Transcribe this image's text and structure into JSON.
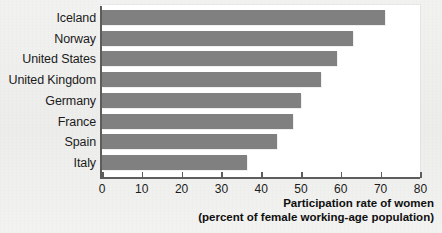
{
  "chart_data": {
    "type": "bar",
    "orientation": "horizontal",
    "title": "",
    "xlabel": "Participation rate of women (percent of female working-age population)",
    "ylabel": "",
    "xlim": [
      0,
      80
    ],
    "ylim": null,
    "grid": false,
    "legend": null,
    "categories": [
      "Iceland",
      "Norway",
      "United States",
      "United Kingdom",
      "Germany",
      "France",
      "Spain",
      "Italy"
    ],
    "values": [
      71,
      63,
      59,
      55,
      50,
      48,
      44,
      36.5
    ],
    "xticks": [
      0,
      10,
      20,
      30,
      40,
      50,
      60,
      70,
      80
    ],
    "xticklabels": [
      "0",
      "10",
      "20",
      "30",
      "40",
      "50",
      "60",
      "70",
      "80"
    ],
    "series": [
      {
        "name": "Participation rate of women",
        "values": [
          71,
          63,
          59,
          55,
          50,
          48,
          44,
          36.5
        ]
      }
    ],
    "bar_color": "#808080",
    "axis_color": "#5d5d5d",
    "panel_color": "#ffffff",
    "background_color": "#f1f1ef"
  },
  "caption": {
    "line1": "Participation rate of women",
    "line2": "(percent of female working-age population)"
  }
}
